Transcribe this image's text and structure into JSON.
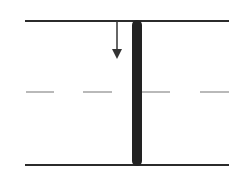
{
  "diagram": {
    "colors": {
      "line": "#2b2b2b",
      "bar": "#222222",
      "dash": "#8a8a8a",
      "arrow": "#333333",
      "background": "#ffffff"
    },
    "elements": {
      "top_line": {
        "x1": 25,
        "x2": 229,
        "y": 21
      },
      "bottom_line": {
        "x1": 25,
        "x2": 229,
        "y": 165
      },
      "mid_dashed_line": {
        "y": 92,
        "dashes": [
          [
            26,
            54
          ],
          [
            83,
            112
          ],
          [
            141,
            170
          ],
          [
            200,
            229
          ]
        ]
      },
      "vertical_bar": {
        "x": 132,
        "width": 10,
        "y1": 21,
        "y2": 165
      },
      "arrow": {
        "x": 117,
        "y1": 21,
        "y2": 58,
        "direction": "down"
      }
    }
  }
}
